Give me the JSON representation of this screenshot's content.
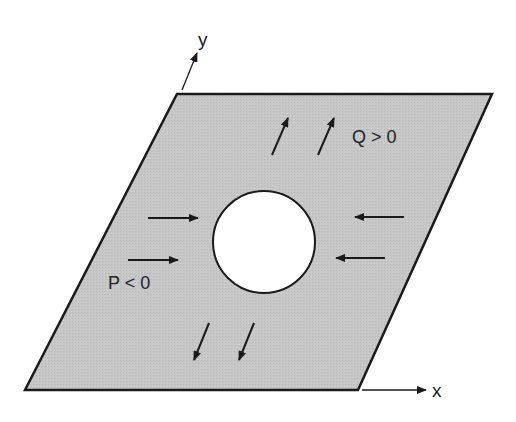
{
  "diagram": {
    "axes": {
      "x_label": "x",
      "y_label": "y"
    },
    "loads": {
      "p_label": "P < 0",
      "q_label": "Q > 0"
    },
    "colors": {
      "plate_fill": "#c4c4c4",
      "outline": "#1a1a1a",
      "hole_fill": "#ffffff",
      "background": "#ffffff"
    }
  }
}
